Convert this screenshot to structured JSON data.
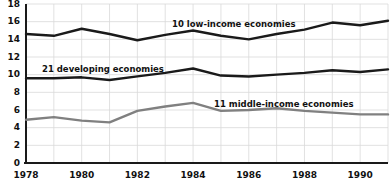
{
  "chart_data": {
    "type": "line",
    "title": "",
    "xlabel": "",
    "ylabel": "",
    "xlim": [
      1978,
      1991
    ],
    "ylim": [
      0,
      18
    ],
    "y_ticks": [
      0,
      2,
      4,
      6,
      8,
      10,
      12,
      14,
      16,
      18
    ],
    "x_ticks": [
      1978,
      1980,
      1982,
      1984,
      1986,
      1988,
      1990
    ],
    "x_tick_labels": [
      "1978",
      "1980",
      "1982",
      "1984",
      "1986",
      "1988",
      "1990"
    ],
    "y_tick_labels": [
      "0",
      "2",
      "4",
      "6",
      "8",
      "10",
      "12",
      "14",
      "16",
      "18"
    ],
    "grid": true,
    "grid_color": "#d9d9d9",
    "legend": "inline-annotations",
    "x": [
      1978,
      1979,
      1980,
      1981,
      1982,
      1983,
      1984,
      1985,
      1986,
      1987,
      1988,
      1989,
      1990,
      1991
    ],
    "series": [
      {
        "name": "10 low-income economies",
        "color": "#1a1a1a",
        "width": 2.4,
        "values": [
          14.6,
          14.4,
          15.2,
          14.6,
          13.9,
          14.5,
          15.0,
          14.4,
          14.0,
          14.6,
          15.1,
          15.9,
          15.6,
          16.1
        ]
      },
      {
        "name": "21 developing economies",
        "color": "#1a1a1a",
        "width": 2.4,
        "values": [
          9.6,
          9.6,
          9.7,
          9.4,
          9.8,
          10.2,
          10.7,
          9.9,
          9.8,
          10.0,
          10.2,
          10.5,
          10.3,
          10.6
        ]
      },
      {
        "name": "11 middle-income economies",
        "color": "#808080",
        "width": 2.4,
        "values": [
          4.9,
          5.2,
          4.8,
          4.6,
          5.9,
          6.4,
          6.8,
          5.9,
          6.0,
          6.2,
          5.9,
          5.7,
          5.5,
          5.5
        ]
      }
    ],
    "annotations": [
      {
        "text": "10 low-income economies",
        "x_px": 172,
        "y_px": 20
      },
      {
        "text": "21 developing economies",
        "x_px": 42,
        "y_px": 65
      },
      {
        "text": "11 middle-income economies",
        "x_px": 214,
        "y_px": 100
      }
    ]
  },
  "axes": {
    "axis_color": "#1a1a1a",
    "plot_left_px": 26,
    "plot_right_px": 388,
    "plot_top_px": 4,
    "plot_bottom_px": 163
  }
}
